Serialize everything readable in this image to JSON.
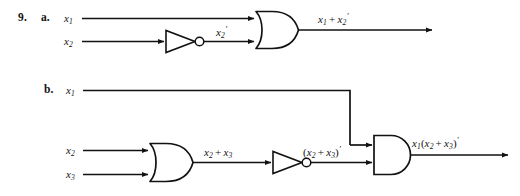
{
  "figure": {
    "item_number": "9.",
    "ink_color": "#121212",
    "background_color": "#ffffff",
    "parts": [
      {
        "letter": "a.",
        "gates": [
          {
            "type": "or-gate",
            "label": "OR"
          },
          {
            "type": "not-gate",
            "label": "NOT"
          }
        ],
        "inputs": [
          {
            "name": "x1",
            "text": "x",
            "sub": "1",
            "prime": ""
          },
          {
            "name": "x2",
            "text": "x",
            "sub": "2",
            "prime": ""
          }
        ],
        "intermediate": [
          {
            "name": "x2-not",
            "text": "x",
            "sub": "2",
            "prime": "′"
          }
        ],
        "output": {
          "name": "or-output",
          "expression": "x1 + x2'",
          "tokens": [
            {
              "v": "x",
              "sub": "1"
            },
            {
              "op": "+"
            },
            {
              "v": "x",
              "sub": "2",
              "prime": "′"
            }
          ]
        }
      },
      {
        "letter": "b.",
        "gates": [
          {
            "type": "or-gate",
            "label": "OR"
          },
          {
            "type": "not-gate",
            "label": "NOT"
          },
          {
            "type": "and-gate",
            "label": "AND"
          }
        ],
        "inputs": [
          {
            "name": "x1",
            "text": "x",
            "sub": "1",
            "prime": ""
          },
          {
            "name": "x2",
            "text": "x",
            "sub": "2",
            "prime": ""
          },
          {
            "name": "x3",
            "text": "x",
            "sub": "3",
            "prime": ""
          }
        ],
        "intermediate": [
          {
            "name": "or-output",
            "expression": "x2 + x3",
            "tokens": [
              {
                "v": "x",
                "sub": "2"
              },
              {
                "op": "+"
              },
              {
                "v": "x",
                "sub": "3"
              }
            ]
          },
          {
            "name": "not-output",
            "expression": "(x2 + x3)'",
            "tokens": [
              {
                "paren": "("
              },
              {
                "v": "x",
                "sub": "2"
              },
              {
                "op": "+"
              },
              {
                "v": "x",
                "sub": "3"
              },
              {
                "paren": ")"
              },
              {
                "prime": "′"
              }
            ]
          }
        ],
        "output": {
          "name": "and-output",
          "expression": "x1(x2 + x3)'",
          "tokens": [
            {
              "v": "x",
              "sub": "1"
            },
            {
              "paren": "("
            },
            {
              "v": "x",
              "sub": "2"
            },
            {
              "op": "+"
            },
            {
              "v": "x",
              "sub": "3"
            },
            {
              "paren": ")"
            },
            {
              "prime": "′"
            }
          ]
        }
      }
    ],
    "labels": {
      "a_in_x1": "x1",
      "a_in_x2": "x2",
      "a_not_out": "x2'",
      "a_out": "x1 + x2'",
      "b_in_x1": "x1",
      "b_in_x2": "x2",
      "b_in_x3": "x3",
      "b_or_out": "x2 + x3",
      "b_not_out": "(x2 + x3)'",
      "b_out": "x1(x2 + x3)'"
    }
  }
}
